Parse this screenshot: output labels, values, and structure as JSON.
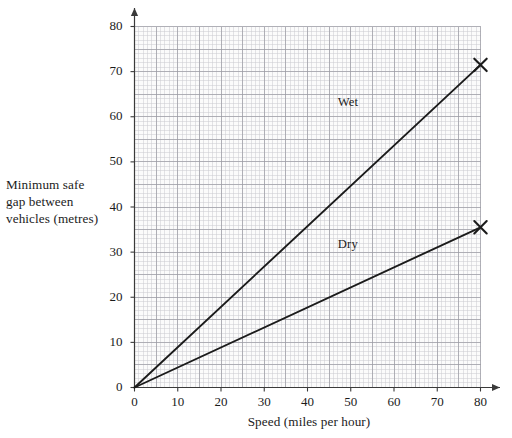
{
  "chart_data": {
    "type": "line",
    "title": "",
    "subtitle": "",
    "xlabel": "Speed (miles per hour)",
    "ylabel": "Minimum safe gap between vehicles (metres)",
    "ylabel_lines": [
      "Minimum safe",
      "gap between",
      "vehicles (metres)"
    ],
    "xlim": [
      0,
      80
    ],
    "ylim": [
      0,
      80
    ],
    "xticks": [
      0,
      10,
      20,
      30,
      40,
      50,
      60,
      70,
      80
    ],
    "yticks": [
      0,
      10,
      20,
      30,
      40,
      50,
      60,
      70,
      80
    ],
    "xtick_labels": [
      "0",
      "10",
      "20",
      "30",
      "40",
      "50",
      "60",
      "70",
      "80"
    ],
    "ytick_labels": [
      "0",
      "10",
      "20",
      "30",
      "40",
      "50",
      "60",
      "70",
      "80"
    ],
    "grid": true,
    "grid_minor_step": 1,
    "grid_major_step": 5,
    "legend": "inline-labels",
    "series": [
      {
        "name": "Wet",
        "label": "Wet",
        "label_x": 50,
        "label_y": 63,
        "marker": "x",
        "marker_at_end": true,
        "x": [
          0,
          80
        ],
        "values": [
          0,
          71.5
        ],
        "endpoint": [
          80,
          71.5
        ]
      },
      {
        "name": "Dry",
        "label": "Dry",
        "label_x": 50,
        "label_y": 31.5,
        "marker": "x",
        "marker_at_end": true,
        "x": [
          0,
          80
        ],
        "values": [
          0,
          35.5
        ],
        "endpoint": [
          80,
          35.5
        ]
      }
    ],
    "annotations": [],
    "colors": {
      "line": "#1b1b1b",
      "axis": "#3a3a3a",
      "grid_minor": "#c9c9cf",
      "grid_major": "#9a9aa3",
      "background": "#ffffff",
      "plot_background": "#fbfbfb",
      "text": "#1b1b1b"
    }
  },
  "axes": {
    "x_arrow": true,
    "y_arrow": true
  }
}
